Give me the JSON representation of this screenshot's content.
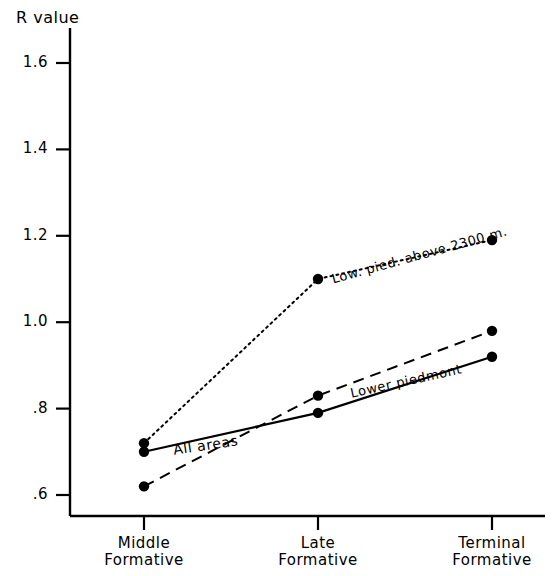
{
  "chart_data": {
    "type": "line",
    "title": "",
    "ylabel": "R value",
    "xlabel": "",
    "categories": [
      "Middle\nFormative",
      "Late\nFormative",
      "Terminal\nFormative"
    ],
    "category_lines": [
      [
        "Middle",
        "Formative"
      ],
      [
        "Late",
        "Formative"
      ],
      [
        "Terminal",
        "Formative"
      ]
    ],
    "ylim": [
      0.52,
      1.7
    ],
    "yticks": [
      0.6,
      0.8,
      1.0,
      1.2,
      1.4,
      1.6
    ],
    "ytick_labels": [
      ".6",
      ".8",
      "1.0",
      "1.2",
      "1.4",
      "1.6"
    ],
    "grid": false,
    "legend_position": "inline-labels",
    "series": [
      {
        "name": "Low. pied. above 2300 m.",
        "style": "dotted",
        "marker": "filled-circle",
        "values": [
          0.72,
          1.1,
          1.19
        ]
      },
      {
        "name": "All areas",
        "style": "solid",
        "marker": "filled-circle",
        "values": [
          0.7,
          0.79,
          0.92
        ]
      },
      {
        "name": "Lower piedmont",
        "style": "dashed",
        "marker": "filled-circle",
        "values": [
          0.62,
          0.83,
          0.98
        ]
      }
    ],
    "annotations": [
      {
        "text": "Low. pied. above 2300 m.",
        "series": "Low. pied. above 2300 m."
      },
      {
        "text": "Lower piedmont",
        "series": "Lower piedmont"
      },
      {
        "text": "All   areas",
        "series": "All areas"
      }
    ],
    "colors": {
      "axis": "#000000",
      "series_line": "#000000",
      "marker": "#000000",
      "background": "#ffffff"
    }
  }
}
